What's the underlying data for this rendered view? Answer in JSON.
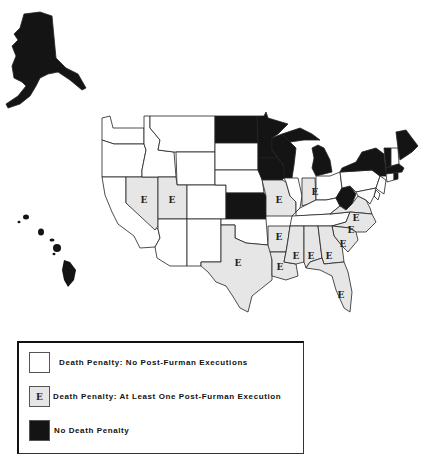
{
  "map": {
    "title": "",
    "exec_marker": "E",
    "categories": {
      "no_executions": {
        "label": "Death Penalty: No Post-Furman Executions",
        "color": "#ffffff"
      },
      "executions": {
        "label": "Death Penalty: At Least One Post-Furman Execution",
        "color": "#e6e6e6",
        "marker": "E"
      },
      "no_death_penalty": {
        "label": "No Death Penalty",
        "color": "#141414"
      }
    },
    "states": {
      "no_death_penalty": [
        "Alaska",
        "Hawaii",
        "North Dakota",
        "Minnesota",
        "Iowa",
        "Kansas",
        "Wisconsin",
        "Michigan",
        "West Virginia",
        "New York",
        "Vermont",
        "Maine",
        "Massachusetts",
        "Rhode Island"
      ],
      "executions": [
        "Nevada",
        "Utah",
        "Texas",
        "Missouri",
        "Arkansas",
        "Louisiana",
        "Mississippi",
        "Alabama",
        "Georgia",
        "Florida",
        "South Carolina",
        "North Carolina",
        "Virginia",
        "Indiana"
      ],
      "no_executions": [
        "Washington",
        "Oregon",
        "California",
        "Idaho",
        "Montana",
        "Wyoming",
        "Arizona",
        "Colorado",
        "New Mexico",
        "South Dakota",
        "Nebraska",
        "Oklahoma",
        "Illinois",
        "Kentucky",
        "Tennessee",
        "Ohio",
        "Pennsylvania",
        "New Jersey",
        "Delaware",
        "Maryland",
        "Connecticut",
        "New Hampshire"
      ]
    }
  },
  "legend": {
    "items": [
      {
        "label": "Death Penalty: No Post-Furman Executions",
        "swatch": "white",
        "marker": ""
      },
      {
        "label": "Death Penalty: At Least One Post-Furman Execution",
        "swatch": "exec",
        "marker": "E"
      },
      {
        "label": "No Death Penalty",
        "swatch": "none",
        "marker": ""
      }
    ]
  }
}
